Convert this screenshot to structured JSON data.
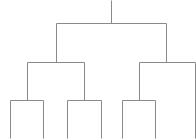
{
  "diagram": {
    "type": "dendrogram",
    "line_color": "#8a8a8a",
    "background": "#ffffff",
    "root": {
      "x": 111,
      "y_top": 0,
      "y_join": 23
    },
    "level1": {
      "y": 23,
      "children_x": [
        56,
        166
      ]
    },
    "level2": [
      {
        "parent_x": 56,
        "y": 62,
        "children_x": [
          27,
          84
        ]
      },
      {
        "parent_x": 166,
        "y": 62,
        "children_x": [
          139,
          195
        ]
      }
    ],
    "level3": [
      {
        "parent_x": 27,
        "y": 100,
        "children_x": [
          10,
          43
        ]
      },
      {
        "parent_x": 84,
        "y": 100,
        "children_x": [
          67,
          101
        ]
      },
      {
        "parent_x": 139,
        "y": 100,
        "children_x": [
          122,
          155
        ]
      }
    ],
    "leaves_bottom_y": 138,
    "leaf_count": 7
  }
}
